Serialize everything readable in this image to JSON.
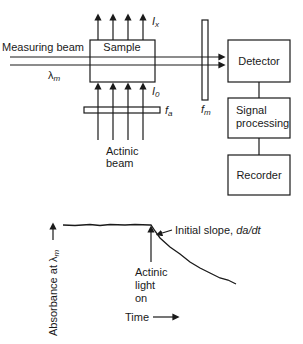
{
  "diagram": {
    "measuring_beam_label": "Measuring beam",
    "lambda_m_label": "λ",
    "lambda_m_sub": "m",
    "sample_label": "Sample",
    "ix_label": "I",
    "ix_sub": "x",
    "i0_label": "I",
    "i0_sub": "0",
    "fa_label": "f",
    "fa_sub": "a",
    "fm_label": "f",
    "fm_sub": "m",
    "actinic_beam_line1": "Actinic",
    "actinic_beam_line2": "beam",
    "detector_label": "Detector",
    "signal_line1": "Signal",
    "signal_line2": "processing",
    "recorder_label": "Recorder"
  },
  "trace": {
    "y_axis_label": "Absorbance at λ",
    "y_axis_sub": "m",
    "x_axis_label": "Time",
    "slope_annotation": "Initial slope, ",
    "slope_italic": "da/dt",
    "actinic_line1": "Actinic",
    "actinic_line2": "light",
    "actinic_line3": "on"
  },
  "colors": {
    "ink": "#1a1a1a",
    "background": "#ffffff"
  }
}
